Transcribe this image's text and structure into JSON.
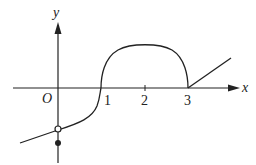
{
  "figure": {
    "type": "function-graph",
    "axes": {
      "x_label": "x",
      "y_label": "y",
      "origin_label": "O",
      "x_ticks": [
        "1",
        "2",
        "3"
      ]
    },
    "pieces": [
      {
        "name": "left-curve",
        "description": "curve increasing from lower-left to open circle at (0, y0) then rising steeply through (1,0)"
      },
      {
        "name": "semicircle",
        "description": "upper semicircle from x=1 to x=3 centered at (2,0), radius 1"
      },
      {
        "name": "ray",
        "description": "straight ray starting at (3,0) going up-right"
      }
    ],
    "points": [
      {
        "name": "open-circle",
        "x": 0,
        "filled": false
      },
      {
        "name": "filled-dot",
        "x": 0,
        "filled": true
      }
    ],
    "colors": {
      "stroke": "#222222",
      "background": "#ffffff"
    }
  }
}
